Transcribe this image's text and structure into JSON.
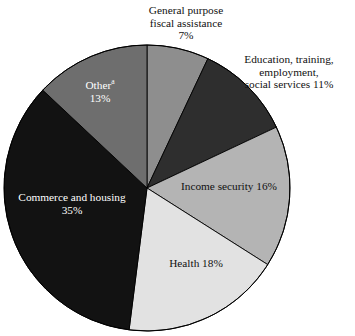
{
  "chart_data": {
    "type": "pie",
    "title": "",
    "subtitle": "",
    "xlabel": "",
    "ylabel": "",
    "legend_position": "none",
    "grid": false,
    "units": "percent",
    "start_angle_deg": 0,
    "direction": "clockwise",
    "center": {
      "x": 147,
      "y": 188
    },
    "radius": 143,
    "categories": [
      "General purpose fiscal assistance",
      "Education, training, employment, social services",
      "Income security",
      "Health",
      "Commerce and housing",
      "Other"
    ],
    "values": [
      7,
      11,
      16,
      18,
      35,
      13
    ],
    "slices": [
      {
        "name": "general-purpose-fiscal-assistance",
        "label": "General purpose\nfiscal assistance\n7%",
        "value": 7,
        "value_text": "7%",
        "color": "#8e8e8e",
        "label_placement": "outside",
        "label_color": "#111111"
      },
      {
        "name": "education-training-employment-social-services",
        "label": "Education, training,\nemployment,\nsocial services 11%",
        "value": 11,
        "value_text": "11%",
        "color": "#2e2e2e",
        "label_placement": "outside",
        "label_color": "#111111"
      },
      {
        "name": "income-security",
        "label": "Income security 16%",
        "value": 16,
        "value_text": "16%",
        "color": "#b4b4b4",
        "label_placement": "inside",
        "label_color": "#111111"
      },
      {
        "name": "health",
        "label": "Health 18%",
        "value": 18,
        "value_text": "18%",
        "color": "#e2e2e2",
        "label_placement": "inside",
        "label_color": "#111111"
      },
      {
        "name": "commerce-and-housing",
        "label": "Commerce and housing\n35%",
        "value": 35,
        "value_text": "35%",
        "color": "#121212",
        "label_placement": "inside",
        "label_color": "#ffffff"
      },
      {
        "name": "other",
        "label": "Other",
        "footnote_marker": "a",
        "value": 13,
        "value_text": "13%",
        "color": "#6e6e6e",
        "label_placement": "inside",
        "label_color": "#ffffff"
      }
    ]
  },
  "labels": {
    "general_purpose": "General purpose\nfiscal assistance\n7%",
    "education": "Education, training,\nemployment,\nsocial services 11%",
    "income_security": "Income security 16%",
    "health": "Health 18%",
    "commerce_housing": "Commerce and housing\n35%",
    "other_name": "Other",
    "other_marker": "a",
    "other_value": "13%"
  },
  "colors": {
    "background": "#ffffff",
    "outline": "#000000",
    "text_dark": "#111111",
    "text_light": "#ffffff"
  }
}
